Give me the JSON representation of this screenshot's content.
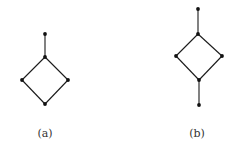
{
  "figure": {
    "colors": {
      "edge": "#1a1a1a",
      "node": "#111111",
      "label": "#333333",
      "background": "#ffffff"
    },
    "diagrams": [
      {
        "id": "a",
        "caption": "(a)",
        "caption_pos": {
          "x": 45,
          "y": 127
        },
        "nodes": [
          {
            "id": "a_top",
            "x": 45,
            "y": 34
          },
          {
            "id": "a_mid",
            "x": 45,
            "y": 57
          },
          {
            "id": "a_left",
            "x": 22,
            "y": 80
          },
          {
            "id": "a_right",
            "x": 68,
            "y": 80
          },
          {
            "id": "a_bottom",
            "x": 45,
            "y": 104
          }
        ],
        "edges": [
          [
            "a_top",
            "a_mid"
          ],
          [
            "a_mid",
            "a_left"
          ],
          [
            "a_mid",
            "a_right"
          ],
          [
            "a_left",
            "a_bottom"
          ],
          [
            "a_right",
            "a_bottom"
          ]
        ]
      },
      {
        "id": "b",
        "caption": "(b)",
        "caption_pos": {
          "x": 197,
          "y": 127
        },
        "nodes": [
          {
            "id": "b_top",
            "x": 198,
            "y": 9
          },
          {
            "id": "b_upper",
            "x": 198,
            "y": 34
          },
          {
            "id": "b_left",
            "x": 176,
            "y": 56
          },
          {
            "id": "b_right",
            "x": 222,
            "y": 56
          },
          {
            "id": "b_lower",
            "x": 199,
            "y": 80
          },
          {
            "id": "b_bottom",
            "x": 199,
            "y": 105
          }
        ],
        "edges": [
          [
            "b_top",
            "b_upper"
          ],
          [
            "b_upper",
            "b_left"
          ],
          [
            "b_upper",
            "b_right"
          ],
          [
            "b_left",
            "b_lower"
          ],
          [
            "b_right",
            "b_lower"
          ],
          [
            "b_lower",
            "b_bottom"
          ]
        ]
      }
    ]
  }
}
